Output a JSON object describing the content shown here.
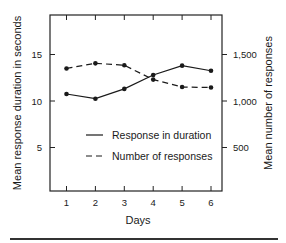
{
  "chart_data": {
    "type": "line",
    "title": "",
    "xlabel": "Days",
    "ylabel_left": "Mean response duration in seconds",
    "ylabel_right": "Mean number of responses",
    "x": [
      1,
      2,
      3,
      4,
      5,
      6
    ],
    "x_ticks": [
      "1",
      "2",
      "3",
      "4",
      "5",
      "6"
    ],
    "ylim_left": [
      0,
      19
    ],
    "ylim_right": [
      0,
      1900
    ],
    "yticks_left": [
      "5",
      "10",
      "15"
    ],
    "yticks_right": [
      "500",
      "1,000",
      "1,500"
    ],
    "grid": false,
    "legend_position": "inside lower center",
    "series": [
      {
        "name": "Response in duration",
        "axis": "left",
        "style": "solid",
        "values": [
          10.75,
          10.25,
          11.3,
          12.8,
          13.8,
          13.25
        ]
      },
      {
        "name": "Number of responses",
        "axis": "right",
        "style": "dashed",
        "values": [
          1350,
          1405,
          1385,
          1230,
          1150,
          1145
        ]
      }
    ]
  }
}
